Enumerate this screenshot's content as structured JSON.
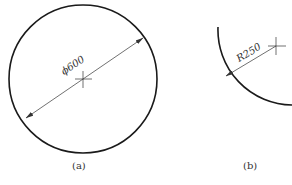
{
  "figure_a": {
    "caption": "(a)",
    "dimension_label": "ϕ600",
    "shape": "full circle",
    "dimension_type": "diameter"
  },
  "figure_b": {
    "caption": "(b)",
    "dimension_label": "R250",
    "shape": "circular arc",
    "dimension_type": "radius"
  },
  "colors": {
    "stroke": "#1a1a1a",
    "dim_line": "#333333",
    "background": "#ffffff"
  }
}
